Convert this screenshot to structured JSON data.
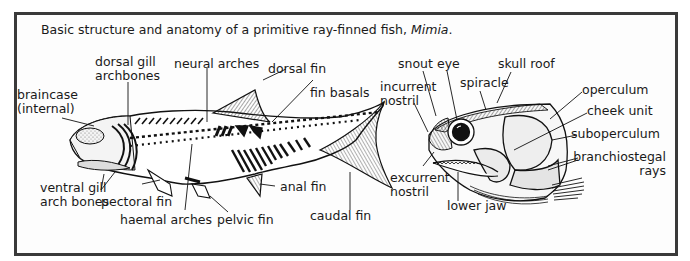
{
  "figure": {
    "caption_prefix": "Basic structure and anatomy of a primitive ray-finned fish, ",
    "caption_genus": "Mimia",
    "caption_suffix": ".",
    "colors": {
      "frame": "#3a3a3a",
      "ink": "#1a1a1a",
      "background": "#fdfdfd",
      "shading": "#cfcfcf"
    }
  },
  "whole_fish": {
    "labels": {
      "braincase_line1": "braincase",
      "braincase_line2": "(internal)",
      "dorsal_gill_line1": "dorsal gill",
      "dorsal_gill_line2": "archbones",
      "neural_arches": "neural arches",
      "dorsal_fin": "dorsal fin",
      "fin_basals": "fin basals",
      "ventral_gill_line1": "ventral gill",
      "ventral_gill_line2": "arch bones",
      "pectoral_fin": "pectoral fin",
      "haemal_arches": "haemal arches",
      "pelvic_fin": "pelvic fin",
      "anal_fin": "anal fin",
      "caudal_fin": "caudal fin"
    }
  },
  "head_detail": {
    "labels": {
      "snout": "snout",
      "eye": "eye",
      "skull_roof": "skull roof",
      "incurrent_line1": "incurrent",
      "incurrent_line2": "nostril",
      "spiracle": "spiracle",
      "operculum": "operculum",
      "cheek_unit": "cheek unit",
      "suboperculum": "suboperculum",
      "branchiostegal_line1": "branchiostegal",
      "branchiostegal_line2": "rays",
      "excurrent_line1": "excurrent",
      "excurrent_line2": "nostril",
      "lower_jaw": "lower jaw"
    }
  }
}
